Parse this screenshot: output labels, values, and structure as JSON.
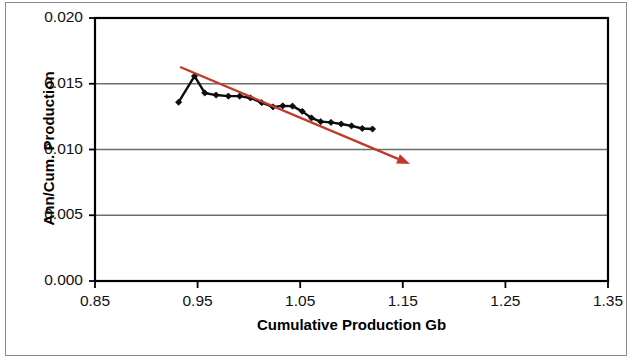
{
  "chart_data": {
    "type": "line",
    "title": "",
    "xlabel": "Cumulative Production Gb",
    "ylabel": "Ann/Cum. Production",
    "xlim": [
      0.85,
      1.35
    ],
    "ylim": [
      0.0,
      0.02
    ],
    "xticks": [
      "0.85",
      "0.95",
      "1.05",
      "1.15",
      "1.25",
      "1.35"
    ],
    "xtick_values": [
      0.85,
      0.95,
      1.05,
      1.15,
      1.25,
      1.35
    ],
    "yticks": [
      "0.000",
      "0.005",
      "0.010",
      "0.015",
      "0.020"
    ],
    "ytick_values": [
      0.0,
      0.005,
      0.01,
      0.015,
      0.02
    ],
    "grid": "horizontal",
    "legend": "none",
    "series": [
      {
        "name": "Ann/Cum. Production",
        "color": "#0d0d0d",
        "marker": "diamond",
        "points": [
          {
            "x": 0.9315,
            "y": 0.0136
          },
          {
            "x": 0.947,
            "y": 0.01558
          },
          {
            "x": 0.957,
            "y": 0.0143
          },
          {
            "x": 0.968,
            "y": 0.01414
          },
          {
            "x": 0.98,
            "y": 0.01406
          },
          {
            "x": 0.991,
            "y": 0.01406
          },
          {
            "x": 1.0015,
            "y": 0.01392
          },
          {
            "x": 1.0125,
            "y": 0.01356
          },
          {
            "x": 1.0235,
            "y": 0.01324
          },
          {
            "x": 1.033,
            "y": 0.01332
          },
          {
            "x": 1.0425,
            "y": 0.0133
          },
          {
            "x": 1.052,
            "y": 0.0129
          },
          {
            "x": 1.061,
            "y": 0.0124
          },
          {
            "x": 1.07,
            "y": 0.01212
          },
          {
            "x": 1.08,
            "y": 0.01206
          },
          {
            "x": 1.09,
            "y": 0.01194
          },
          {
            "x": 1.1,
            "y": 0.0118
          },
          {
            "x": 1.1105,
            "y": 0.0116
          },
          {
            "x": 1.1205,
            "y": 0.01156
          }
        ]
      }
    ],
    "annotations": [
      {
        "type": "trend-arrow",
        "color": "#c0392b",
        "x_start": 0.933,
        "y_start": 0.01627,
        "x_end": 1.157,
        "y_end": 0.0089
      }
    ]
  },
  "axes": {
    "y_axis_label": "Ann/Cum. Production",
    "x_axis_label": "Cumulative Production Gb"
  },
  "colors": {
    "series_line": "#0d0d0d",
    "trend_arrow": "#c0392b",
    "gridline": "#6e6e6e",
    "axis": "#000000",
    "frame": "#8a8a8a",
    "background": "#ffffff"
  }
}
